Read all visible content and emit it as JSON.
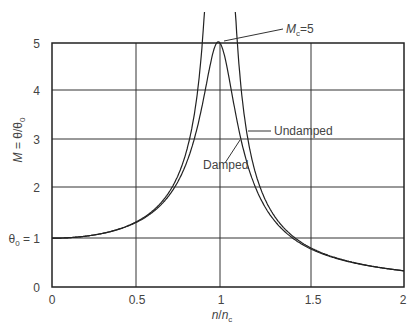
{
  "chart_data": {
    "type": "line",
    "title": "",
    "xlabel": "n/n_c",
    "ylabel": "M = θ/θ0",
    "xlim": [
      0,
      2
    ],
    "ylim": [
      0,
      5
    ],
    "grid": true,
    "x_ticks": [
      "0",
      "0.5",
      "1",
      "1.5",
      "2"
    ],
    "y_ticks": [
      "0",
      "θ0 = 1",
      "2",
      "3",
      "4",
      "5"
    ],
    "series": [
      {
        "name": "Undamped",
        "x": [
          0,
          0.25,
          0.5,
          0.75,
          0.9,
          0.95,
          1.05,
          1.1,
          1.25,
          1.5,
          1.75,
          2
        ],
        "values": [
          1.0,
          1.07,
          1.33,
          2.29,
          5.26,
          10.3,
          9.76,
          4.76,
          1.78,
          0.8,
          0.48,
          0.33
        ]
      },
      {
        "name": "Damped",
        "x": [
          0,
          0.25,
          0.5,
          0.75,
          0.9,
          1.0,
          1.1,
          1.25,
          1.5,
          1.75,
          2
        ],
        "values": [
          1.0,
          1.06,
          1.32,
          2.17,
          3.73,
          5.0,
          3.39,
          1.68,
          0.79,
          0.48,
          0.33
        ]
      }
    ],
    "annotations": [
      {
        "text": "Mc = 5",
        "target": "damped peak at n/nc = 1"
      },
      {
        "text": "Undamped",
        "target": "undamped curve"
      },
      {
        "text": "Damped",
        "target": "damped curve"
      }
    ]
  },
  "labels": {
    "x_axis_n": "n",
    "x_axis_sep": "/",
    "x_axis_nc": "n",
    "x_axis_nc_sub": "c",
    "y_axis_M": "M",
    "y_axis_rest": " = θ/θ",
    "y_axis_sub": "0",
    "y_one_theta": "θ",
    "y_one_sub": "0",
    "y_one_rest": " = 1",
    "mc_M": "M",
    "mc_sub": "c",
    "mc_rest": "=5",
    "undamped": "Undamped",
    "damped": "Damped",
    "xt0": "0",
    "xt1": "0.5",
    "xt2": "1",
    "xt3": "1.5",
    "xt4": "2",
    "yt0": "0",
    "yt2": "2",
    "yt3": "3",
    "yt4": "4",
    "yt5": "5"
  },
  "params": {
    "zeta": 0.1
  }
}
